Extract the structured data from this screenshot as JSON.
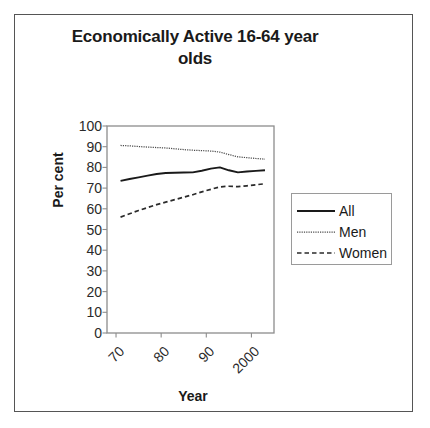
{
  "figure": {
    "border_color": "#555555",
    "background": "#ffffff"
  },
  "chart_data": {
    "type": "line",
    "title": "Economically Active 16-64 year olds",
    "title_line1": "Economically Active 16-64 year",
    "title_line2": "olds",
    "xlabel": "Year",
    "ylabel": "Per cent",
    "ylim": [
      0,
      100
    ],
    "ytick_labels": [
      "100",
      "90",
      "80",
      "70",
      "60",
      "50",
      "40",
      "30",
      "20",
      "10",
      "0"
    ],
    "ytick_values": [
      100,
      90,
      80,
      70,
      60,
      50,
      40,
      30,
      20,
      10,
      0
    ],
    "xtick_labels": [
      "70",
      "80",
      "90",
      "2000"
    ],
    "xtick_values": [
      1970,
      1980,
      1990,
      2000
    ],
    "xlim": [
      1968,
      2005
    ],
    "grid": false,
    "legend_position": "right",
    "x": [
      1971,
      1973,
      1975,
      1977,
      1979,
      1981,
      1983,
      1985,
      1987,
      1989,
      1991,
      1993,
      1995,
      1997,
      1999,
      2001,
      2003
    ],
    "series": [
      {
        "name": "All",
        "style": "solid",
        "color": "#1a1a1a",
        "values": [
          73.5,
          74.4,
          75.2,
          76.0,
          76.8,
          77.3,
          77.4,
          77.5,
          77.6,
          78.4,
          79.4,
          80.0,
          78.6,
          77.6,
          78.0,
          78.3,
          78.6
        ]
      },
      {
        "name": "Men",
        "style": "dotted",
        "color": "#4a4a4a",
        "values": [
          90.6,
          90.4,
          90.1,
          89.8,
          89.6,
          89.4,
          89.0,
          88.6,
          88.3,
          88.1,
          87.9,
          87.4,
          86.2,
          85.1,
          84.7,
          84.3,
          84.0
        ]
      },
      {
        "name": "Women",
        "style": "dashed",
        "color": "#2a2a2a",
        "values": [
          56.0,
          57.6,
          59.2,
          60.6,
          62.0,
          63.2,
          64.4,
          65.6,
          66.8,
          68.2,
          69.4,
          70.6,
          70.9,
          70.7,
          71.1,
          71.6,
          72.1
        ]
      }
    ]
  },
  "legend": {
    "items": [
      {
        "label": "All",
        "style": "solid"
      },
      {
        "label": "Men",
        "style": "dotted"
      },
      {
        "label": "Women",
        "style": "dashed"
      }
    ]
  }
}
